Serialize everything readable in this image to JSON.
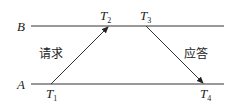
{
  "diagram": {
    "lines": {
      "top_label": "B",
      "bottom_label": "A"
    },
    "times": [
      {
        "base": "T",
        "sub": "1"
      },
      {
        "base": "T",
        "sub": "2"
      },
      {
        "base": "T",
        "sub": "3"
      },
      {
        "base": "T",
        "sub": "4"
      }
    ],
    "arrows": {
      "request_label": "请求",
      "response_label": "应答"
    },
    "colors": {
      "stroke": "#333333"
    }
  }
}
